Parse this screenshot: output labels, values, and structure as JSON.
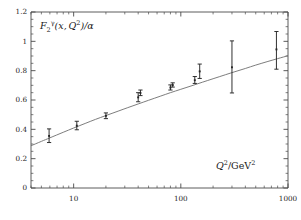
{
  "figure": {
    "background": "#ffffff",
    "axis_color": "#4a4a4a",
    "curve_color": "#6e6e6e",
    "marker_color": "#262626"
  },
  "chart_data": {
    "type": "scatter",
    "title": "",
    "subtitle": "",
    "xlabel": "Q^2/GeV^2",
    "ylabel": "F_2^gamma(x,Q^2)/alpha",
    "xscale": "log",
    "yscale": "linear",
    "xlim": [
      4.0,
      1000
    ],
    "ylim": [
      0,
      1.2
    ],
    "grid": false,
    "legend": null,
    "xticks": [
      10,
      100,
      1000
    ],
    "xticklabels": [
      "10",
      "100",
      "1000"
    ],
    "yticks": [
      0,
      0.2,
      0.4,
      0.6,
      0.8,
      1,
      1.2
    ],
    "yticklabels": [
      "0",
      "0.2",
      "0.4",
      "0.6",
      "0.8",
      "1",
      "1.2"
    ],
    "series": [
      {
        "name": "data",
        "marker": "point-with-errorbars",
        "points": [
          {
            "x": 5.9,
            "y": 0.355,
            "yerr_lo": 0.045,
            "yerr_hi": 0.048
          },
          {
            "x": 10.7,
            "y": 0.425,
            "yerr_lo": 0.028,
            "yerr_hi": 0.03
          },
          {
            "x": 20.0,
            "y": 0.492,
            "yerr_lo": 0.019,
            "yerr_hi": 0.02
          },
          {
            "x": 40.0,
            "y": 0.618,
            "yerr_lo": 0.03,
            "yerr_hi": 0.032
          },
          {
            "x": 42.0,
            "y": 0.648,
            "yerr_lo": 0.018,
            "yerr_hi": 0.02
          },
          {
            "x": 80.0,
            "y": 0.685,
            "yerr_lo": 0.017,
            "yerr_hi": 0.018
          },
          {
            "x": 84.0,
            "y": 0.702,
            "yerr_lo": 0.014,
            "yerr_hi": 0.015
          },
          {
            "x": 135.0,
            "y": 0.735,
            "yerr_lo": 0.022,
            "yerr_hi": 0.025
          },
          {
            "x": 150.0,
            "y": 0.795,
            "yerr_lo": 0.048,
            "yerr_hi": 0.05
          },
          {
            "x": 300.0,
            "y": 0.823,
            "yerr_lo": 0.175,
            "yerr_hi": 0.18
          },
          {
            "x": 780.0,
            "y": 0.945,
            "yerr_lo": 0.135,
            "yerr_hi": 0.122
          }
        ]
      },
      {
        "name": "theory-curve",
        "marker": "line",
        "curve": [
          {
            "x": 4.0,
            "y": 0.288
          },
          {
            "x": 5.0,
            "y": 0.318
          },
          {
            "x": 6.0,
            "y": 0.342
          },
          {
            "x": 8.0,
            "y": 0.38
          },
          {
            "x": 10.0,
            "y": 0.409
          },
          {
            "x": 13.0,
            "y": 0.442
          },
          {
            "x": 16.0,
            "y": 0.468
          },
          {
            "x": 20.0,
            "y": 0.494
          },
          {
            "x": 26.0,
            "y": 0.524
          },
          {
            "x": 32.0,
            "y": 0.548
          },
          {
            "x": 40.0,
            "y": 0.573
          },
          {
            "x": 50.0,
            "y": 0.598
          },
          {
            "x": 65.0,
            "y": 0.627
          },
          {
            "x": 80.0,
            "y": 0.65
          },
          {
            "x": 100.0,
            "y": 0.673
          },
          {
            "x": 130.0,
            "y": 0.7
          },
          {
            "x": 160.0,
            "y": 0.722
          },
          {
            "x": 200.0,
            "y": 0.745
          },
          {
            "x": 260.0,
            "y": 0.772
          },
          {
            "x": 320.0,
            "y": 0.793
          },
          {
            "x": 400.0,
            "y": 0.815
          },
          {
            "x": 500.0,
            "y": 0.838
          },
          {
            "x": 650.0,
            "y": 0.863
          },
          {
            "x": 800.0,
            "y": 0.882
          },
          {
            "x": 1000.0,
            "y": 0.902
          }
        ]
      }
    ]
  },
  "labels": {
    "ylabel_main": "F",
    "ylabel_sub": "2",
    "ylabel_sup": "γ",
    "ylabel_args": "(x, Q",
    "ylabel_args_sup": "2",
    "ylabel_tail": ")/α",
    "xlabel_main": "Q",
    "xlabel_sup": "2",
    "xlabel_den": "/GeV",
    "xlabel_den_sup": "2",
    "ytick_0": "0",
    "ytick_1": "0.2",
    "ytick_2": "0.4",
    "ytick_3": "0.6",
    "ytick_4": "0.8",
    "ytick_5": "1",
    "ytick_6": "1.2",
    "xtick_0": "10",
    "xtick_1": "100",
    "xtick_2": "1000"
  }
}
